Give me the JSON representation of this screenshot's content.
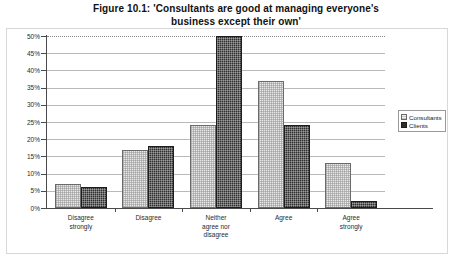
{
  "chart_data": {
    "type": "bar",
    "title": "Figure 10.1: 'Consultants are good at managing everyone's business except their own'",
    "title_line1": "Figure 10.1: 'Consultants are good at managing everyone's",
    "title_line2": "business except their own'",
    "xlabel": "",
    "ylabel": "",
    "ylim": [
      0,
      50
    ],
    "ytick_labels": [
      "0%",
      "5%",
      "10%",
      "15%",
      "20%",
      "25%",
      "30%",
      "35%",
      "40%",
      "45%",
      "50%"
    ],
    "ytick_values": [
      0,
      5,
      10,
      15,
      20,
      25,
      30,
      35,
      40,
      45,
      50
    ],
    "grid": true,
    "legend_position": "right",
    "categories": [
      "Disagree strongly",
      "Disagree",
      "Neither agree nor disagree",
      "Agree",
      "Agree strongly"
    ],
    "category_lines": [
      [
        "Disagree",
        "strongly"
      ],
      [
        "Disagree"
      ],
      [
        "Neither",
        "agree nor",
        "disagree"
      ],
      [
        "Agree"
      ],
      [
        "Agree",
        "strongly"
      ]
    ],
    "series": [
      {
        "name": "Consultants",
        "color": "#e9e9e9",
        "values": [
          7,
          17,
          24,
          37,
          13
        ]
      },
      {
        "name": "Clients",
        "color": "#2e2e2e",
        "values": [
          6,
          18,
          50,
          24,
          2
        ]
      }
    ]
  },
  "legend": {
    "items": [
      {
        "label": "Consultants"
      },
      {
        "label": "Clients"
      }
    ]
  }
}
